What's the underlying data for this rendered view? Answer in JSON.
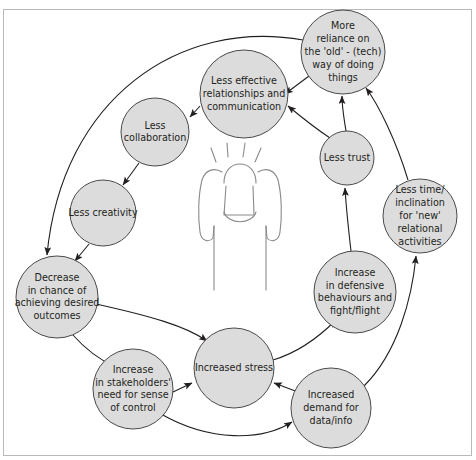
{
  "diagram": {
    "colors": {
      "node_fill": "#dddcdc",
      "node_stroke": "#4a4a4a",
      "edge": "#231f20",
      "frame": "#b9b9b9",
      "figure": "#8a8a8a",
      "background": "#ffffff",
      "text": "#231f20"
    },
    "center_figure": {
      "name": "stressed-person-head-in-hands",
      "description": "Outline of a person holding their head with both hands, radiating stress lines above"
    },
    "nodes": [
      {
        "id": "more-reliance",
        "name": "node-more-reliance-on-old-tech",
        "cx": 343,
        "cy": 52,
        "r": 42,
        "font_size": 9.6,
        "lines": [
          "More",
          "reliance on",
          "the 'old' - (tech)",
          "way of doing",
          "things"
        ]
      },
      {
        "id": "less-effective",
        "name": "node-less-effective-relationships",
        "cx": 244,
        "cy": 94,
        "r": 44,
        "font_size": 9.6,
        "lines": [
          "Less effective",
          "relationships and",
          "communication"
        ]
      },
      {
        "id": "less-collaboration",
        "name": "node-less-collaboration",
        "cx": 155,
        "cy": 132,
        "r": 34,
        "font_size": 9.6,
        "lines": [
          "Less",
          "collaboration"
        ]
      },
      {
        "id": "less-trust",
        "name": "node-less-trust",
        "cx": 347,
        "cy": 158,
        "r": 27,
        "font_size": 9.6,
        "lines": [
          "Less trust"
        ]
      },
      {
        "id": "less-time",
        "name": "node-less-time-inclination",
        "cx": 420,
        "cy": 216,
        "r": 37,
        "font_size": 9.6,
        "lines": [
          "Less time/",
          "inclination",
          "for 'new'",
          "relational",
          "activities"
        ]
      },
      {
        "id": "less-creativity",
        "name": "node-less-creativity",
        "cx": 103,
        "cy": 213,
        "r": 33,
        "font_size": 9.6,
        "lines": [
          "Less creativity"
        ]
      },
      {
        "id": "decrease-chance",
        "name": "node-decrease-in-chance-of-achieving",
        "cx": 57,
        "cy": 297,
        "r": 41,
        "font_size": 9.6,
        "lines": [
          "Decrease",
          "in chance of",
          "achieving desired",
          "outcomes"
        ]
      },
      {
        "id": "increase-defensive",
        "name": "node-increase-in-defensive-behaviours",
        "cx": 355,
        "cy": 292,
        "r": 41,
        "font_size": 9.6,
        "lines": [
          "Increase",
          "in defensive",
          "behaviours and",
          "fight/flight"
        ]
      },
      {
        "id": "increase-stakeholders",
        "name": "node-increase-in-stakeholders-need-for-control",
        "cx": 133,
        "cy": 389,
        "r": 40,
        "font_size": 9.6,
        "lines": [
          "Increase",
          "in stakeholders'",
          "need for sense",
          "of control"
        ]
      },
      {
        "id": "increased-stress",
        "name": "node-increased-stress",
        "cx": 234,
        "cy": 368,
        "r": 40,
        "font_size": 9.6,
        "lines": [
          "Increased stress"
        ]
      },
      {
        "id": "increased-demand",
        "name": "node-increased-demand-for-data",
        "cx": 331,
        "cy": 408,
        "r": 40,
        "font_size": 9.6,
        "lines": [
          "Increased",
          "demand for",
          "data/info"
        ]
      }
    ],
    "edges": [
      {
        "name": "edge-more-reliance-to-less-effective",
        "from": "more-reliance",
        "to": "less-effective",
        "path": "M 309 76 L 285 94"
      },
      {
        "name": "edge-less-effective-to-less-collaboration",
        "from": "less-effective",
        "to": "less-collaboration",
        "path": "M 200 106 L 190 117"
      },
      {
        "name": "edge-less-collaboration-to-less-creativity",
        "from": "less-collaboration",
        "to": "less-creativity",
        "path": "M 139 163 L 123 185"
      },
      {
        "name": "edge-less-creativity-to-decrease-chance",
        "from": "less-creativity",
        "to": "decrease-chance",
        "path": "M 89 244 L 75 261"
      },
      {
        "name": "edge-outer-arc-more-reliance-to-decrease-chance",
        "from": "more-reliance",
        "to": "decrease-chance",
        "path": "M 303 40 C 180 18, 62 98, 47 255"
      },
      {
        "name": "edge-less-trust-to-more-reliance",
        "from": "less-trust",
        "to": "more-reliance",
        "path": "M 346 131 C 344 118, 342 108, 342 96"
      },
      {
        "name": "edge-less-effective-to-less-trust",
        "from": "less-effective",
        "to": "less-trust",
        "path": "M 330 138 C 312 126, 300 116, 288 106"
      },
      {
        "name": "edge-less-time-to-more-reliance",
        "from": "less-time",
        "to": "more-reliance",
        "path": "M 408 180 C 396 140, 378 104, 366 88"
      },
      {
        "name": "edge-increase-defensive-to-less-trust",
        "from": "increase-defensive",
        "to": "less-trust",
        "path": "M 351 251 C 348 225, 346 205, 345 188"
      },
      {
        "name": "edge-increased-demand-to-less-time",
        "from": "increased-demand",
        "to": "less-time",
        "path": "M 364 386 C 398 352, 412 298, 416 256"
      },
      {
        "name": "edge-increased-stress-to-increase-defensive",
        "from": "increased-stress",
        "to": "increase-defensive",
        "path": "M 273 360 C 300 352, 322 334, 336 320"
      },
      {
        "name": "edge-decrease-chance-to-increased-stress",
        "from": "decrease-chance",
        "to": "increased-stress",
        "path": "M 96 304 C 150 316, 186 326, 207 341"
      },
      {
        "name": "edge-decrease-chance-to-increase-stakeholders",
        "from": "decrease-chance",
        "to": "increase-stakeholders",
        "path": "M 72 334 C 88 352, 100 360, 114 366"
      },
      {
        "name": "edge-increase-stakeholders-to-increased-stress",
        "from": "increase-stakeholders",
        "to": "increased-stress",
        "path": "M 173 392 L 192 383"
      },
      {
        "name": "edge-increase-stakeholders-to-increased-demand",
        "from": "increase-stakeholders",
        "to": "increased-demand",
        "path": "M 161 414 C 210 442, 262 441, 292 422"
      },
      {
        "name": "edge-increased-demand-to-increased-stress",
        "from": "increased-demand",
        "to": "increased-stress",
        "path": "M 298 392 C 287 388, 282 386, 274 383"
      }
    ]
  }
}
